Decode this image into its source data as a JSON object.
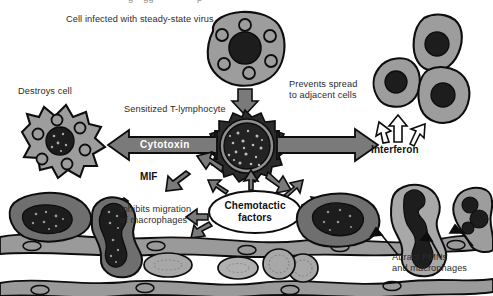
{
  "figure": {
    "kind": "biology-diagram",
    "title_cut_off": "g    gg                 p",
    "palette": {
      "cell_fill": "#9d9d9d",
      "cell_fill_light": "#b3b3b3",
      "cell_fill_dark": "#6f6f6f",
      "nucleus_dark": "#1d1d1d",
      "arrow_gray": "#7a7a7a",
      "outline": "#0d0d0d",
      "vessel_fill": "#9a9a9a",
      "white": "#ffffff",
      "text": "#2b2b2b"
    }
  },
  "labels": {
    "infected_cell": "Cell infected with steady-state virus",
    "destroys_cell": "Destroys cell",
    "sensitized_t": "Sensitized T-lymphocyte",
    "prevents_spread_l1": "Prevents spread",
    "prevents_spread_l2": "to adjacent cells",
    "cytotoxin": "Cytotoxin",
    "interferon": "Interferon",
    "mif": "MIF",
    "inhibits_l1": "Inhibits migration",
    "inhibits_l2": "of macrophages",
    "chemotactic_l1": "Chemotactic",
    "chemotactic_l2": "factors",
    "attract_l1": "Attract PMNs",
    "attract_l2": "and macrophages"
  },
  "structures": {
    "infected_cell_vesicles": 6,
    "destroyed_cell_vesicles": 6,
    "adjacent_cells": 3,
    "endothelium_layers": 2,
    "red_blood_cells": 3,
    "pmn_count": 2,
    "macrophage_count": 2
  }
}
